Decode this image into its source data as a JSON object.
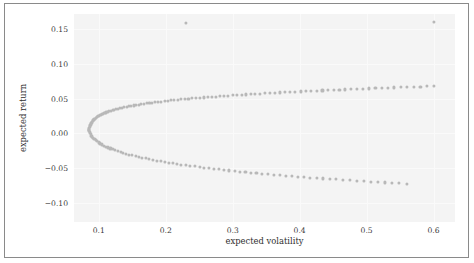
{
  "chart_data": {
    "type": "scatter",
    "title": "",
    "xlabel": "expected volatility",
    "ylabel": "expected return",
    "xlim": [
      0.063,
      0.632
    ],
    "ylim": [
      -0.128,
      0.172
    ],
    "xticks": [
      0.1,
      0.2,
      0.3,
      0.4,
      0.5,
      0.6
    ],
    "xtick_labels": [
      "0.1",
      "0.2",
      "0.3",
      "0.4",
      "0.5",
      "0.6"
    ],
    "yticks": [
      -0.1,
      -0.05,
      0.0,
      0.05,
      0.1,
      0.15
    ],
    "ytick_labels": [
      "-0.10",
      "-0.05",
      "0.00",
      "0.05",
      "0.10",
      "0.15"
    ],
    "grid": true,
    "legend": null,
    "marker_color": "#b8b8b8",
    "marker_size": 3,
    "plot_background": "#f4f4f4",
    "figure_background": "#ffffff",
    "frame_color": "#8a8a8a",
    "series": [
      {
        "name": "upper branch (efficient frontier)",
        "x": [
          0.0855,
          0.0857,
          0.086,
          0.0864,
          0.0869,
          0.0875,
          0.0882,
          0.089,
          0.0899,
          0.0909,
          0.092,
          0.0932,
          0.0945,
          0.0959,
          0.0974,
          0.099,
          0.1007,
          0.1025,
          0.1044,
          0.1064,
          0.1085,
          0.1107,
          0.113,
          0.1154,
          0.1179,
          0.1205,
          0.1232,
          0.126,
          0.1289,
          0.1319,
          0.135,
          0.1382,
          0.1415,
          0.1449,
          0.1484,
          0.152,
          0.1557,
          0.1595,
          0.1634,
          0.1674,
          0.1715,
          0.1757,
          0.18,
          0.1844,
          0.1889,
          0.1935,
          0.1982,
          0.203,
          0.2079,
          0.2129,
          0.218,
          0.2232,
          0.2285,
          0.2339,
          0.2394,
          0.245,
          0.2507,
          0.2565,
          0.2624,
          0.2684,
          0.2745,
          0.2807,
          0.287,
          0.2934,
          0.2999,
          0.3065,
          0.3132,
          0.32,
          0.3269,
          0.3339,
          0.341,
          0.3482,
          0.3555,
          0.3629,
          0.3704,
          0.378,
          0.3857,
          0.3935,
          0.4014,
          0.4094,
          0.4175,
          0.4257,
          0.434,
          0.4424,
          0.4509,
          0.4595,
          0.4682,
          0.477,
          0.4859,
          0.4949,
          0.504,
          0.5132,
          0.5225,
          0.5319,
          0.5414,
          0.551,
          0.5607,
          0.5705,
          0.5804,
          0.5904,
          0.6005
        ],
        "y": [
          0.005,
          0.0065,
          0.008,
          0.0095,
          0.011,
          0.0124,
          0.0138,
          0.0151,
          0.0164,
          0.0177,
          0.0189,
          0.0201,
          0.0212,
          0.0223,
          0.0234,
          0.0244,
          0.0254,
          0.0264,
          0.0273,
          0.0282,
          0.0291,
          0.03,
          0.0308,
          0.0316,
          0.0324,
          0.0332,
          0.034,
          0.0347,
          0.0354,
          0.0361,
          0.0368,
          0.0375,
          0.0382,
          0.0388,
          0.0395,
          0.0401,
          0.0407,
          0.0413,
          0.0419,
          0.0425,
          0.0431,
          0.0436,
          0.0442,
          0.0447,
          0.0453,
          0.0458,
          0.0463,
          0.0468,
          0.0474,
          0.0479,
          0.0484,
          0.0489,
          0.0493,
          0.0498,
          0.0503,
          0.0508,
          0.0512,
          0.0517,
          0.0521,
          0.0526,
          0.053,
          0.0535,
          0.0539,
          0.0543,
          0.0548,
          0.0552,
          0.0556,
          0.056,
          0.0564,
          0.0568,
          0.0572,
          0.0576,
          0.058,
          0.0584,
          0.0588,
          0.0592,
          0.0596,
          0.06,
          0.0603,
          0.0607,
          0.0611,
          0.0614,
          0.0618,
          0.0622,
          0.0625,
          0.0629,
          0.0632,
          0.0636,
          0.0639,
          0.0643,
          0.0646,
          0.065,
          0.0653,
          0.0656,
          0.066,
          0.0663,
          0.0666,
          0.067,
          0.0673,
          0.0676,
          0.0679
        ]
      },
      {
        "name": "lower branch (inefficient frontier)",
        "x": [
          0.0855,
          0.0858,
          0.0863,
          0.087,
          0.0879,
          0.089,
          0.0903,
          0.0918,
          0.0935,
          0.0954,
          0.0975,
          0.0998,
          0.1023,
          0.105,
          0.1078,
          0.1108,
          0.114,
          0.1174,
          0.1209,
          0.1246,
          0.1285,
          0.1325,
          0.1367,
          0.141,
          0.1455,
          0.1501,
          0.1549,
          0.1598,
          0.1649,
          0.1701,
          0.1755,
          0.181,
          0.1866,
          0.1924,
          0.1983,
          0.2044,
          0.2106,
          0.2169,
          0.2234,
          0.23,
          0.2367,
          0.2435,
          0.2505,
          0.2576,
          0.2648,
          0.2722,
          0.2797,
          0.2873,
          0.295,
          0.3029,
          0.3109,
          0.319,
          0.3272,
          0.3355,
          0.344,
          0.3526,
          0.3613,
          0.3701,
          0.379,
          0.3881,
          0.3973,
          0.4066,
          0.416,
          0.4255,
          0.4351,
          0.4449,
          0.4548,
          0.4648,
          0.4749,
          0.4851,
          0.4954,
          0.5059,
          0.5165,
          0.5272,
          0.538,
          0.5489,
          0.56
        ],
        "y": [
          0.005,
          0.0034,
          0.0018,
          0.0001,
          -0.0016,
          -0.0033,
          -0.005,
          -0.0067,
          -0.0084,
          -0.01,
          -0.0116,
          -0.0132,
          -0.0147,
          -0.0162,
          -0.0177,
          -0.0191,
          -0.0205,
          -0.0219,
          -0.0232,
          -0.0245,
          -0.0258,
          -0.0271,
          -0.0283,
          -0.0295,
          -0.0307,
          -0.0318,
          -0.033,
          -0.0341,
          -0.0352,
          -0.0362,
          -0.0373,
          -0.0383,
          -0.0393,
          -0.0403,
          -0.0413,
          -0.0423,
          -0.0432,
          -0.0442,
          -0.0451,
          -0.046,
          -0.0469,
          -0.0478,
          -0.0486,
          -0.0495,
          -0.0503,
          -0.0512,
          -0.052,
          -0.0528,
          -0.0536,
          -0.0544,
          -0.0552,
          -0.0559,
          -0.0567,
          -0.0575,
          -0.0582,
          -0.0589,
          -0.0597,
          -0.0604,
          -0.0611,
          -0.0618,
          -0.0625,
          -0.0632,
          -0.0639,
          -0.0646,
          -0.0652,
          -0.0659,
          -0.0665,
          -0.0672,
          -0.0678,
          -0.0685,
          -0.0691,
          -0.0697,
          -0.0703,
          -0.071,
          -0.0716,
          -0.0722,
          -0.0728
        ]
      },
      {
        "name": "outliers",
        "x": [
          0.2305,
          0.6005
        ],
        "y": [
          0.159,
          0.1605
        ]
      }
    ]
  }
}
